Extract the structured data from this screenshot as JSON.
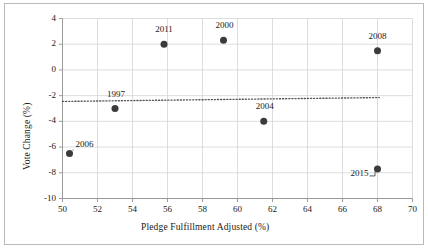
{
  "chart_data": {
    "type": "scatter",
    "title": "",
    "xlabel": "Pledge Fulfillment Adjusted (%)",
    "ylabel": "Vote Change (%)",
    "xlim": [
      50,
      70
    ],
    "ylim": [
      -10,
      4
    ],
    "xticks": [
      50,
      52,
      54,
      56,
      58,
      60,
      62,
      64,
      66,
      68,
      70
    ],
    "yticks": [
      4,
      2,
      0,
      -2,
      -4,
      -6,
      -8,
      -10
    ],
    "grid": true,
    "legend": "none",
    "points": [
      {
        "label": "2006",
        "x": 50.4,
        "y": -6.5,
        "label_dx": 15,
        "label_dy": -9
      },
      {
        "label": "1997",
        "x": 53.0,
        "y": -3.0,
        "label_dx": 1,
        "label_dy": -14
      },
      {
        "label": "2011",
        "x": 55.8,
        "y": 2.0,
        "label_dx": 0,
        "label_dy": -14
      },
      {
        "label": "2000",
        "x": 59.2,
        "y": 2.3,
        "label_dx": 1,
        "label_dy": -14
      },
      {
        "label": "2004",
        "x": 61.5,
        "y": -4.0,
        "label_dx": 1,
        "label_dy": -14
      },
      {
        "label": "2008",
        "x": 68.0,
        "y": 1.5,
        "label_dx": 0,
        "label_dy": -14
      },
      {
        "label": "2015",
        "x": 68.0,
        "y": -7.7,
        "label_dx": -18,
        "label_dy": 5
      }
    ],
    "trendline": {
      "style": "dotted",
      "x_start": 50.0,
      "x_end": 68.1,
      "y_start": -2.45,
      "y_end": -2.15
    },
    "marker": {
      "shape": "circle",
      "color": "#3b3b3b",
      "size": 4.6
    },
    "axis_color": "#9a9a9a",
    "grid_color": "#d4d4d4",
    "text_color": "#1a1a1a"
  }
}
